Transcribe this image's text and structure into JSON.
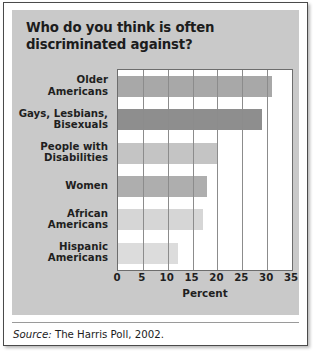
{
  "title": "Who do you think is often discriminated against?",
  "source": {
    "label": "Source:",
    "text": "The Harris Poll, 2002."
  },
  "chart_data": {
    "type": "bar",
    "orientation": "horizontal",
    "title": "Who do you think is often discriminated against?",
    "xlabel": "Percent",
    "ylabel": "",
    "xlim": [
      0,
      35
    ],
    "xticks": [
      0,
      5,
      10,
      15,
      20,
      25,
      30,
      35
    ],
    "grid": true,
    "legend": null,
    "categories": [
      "Older Americans",
      "Gays, Lesbians, Bisexuals",
      "People with Disabilities",
      "Women",
      "African Americans",
      "Hispanic Americans"
    ],
    "values": [
      31,
      29,
      20,
      18,
      17,
      12
    ],
    "colors": [
      "#a8a8a8",
      "#8e8e8e",
      "#c4c4c4",
      "#aeaeae",
      "#d6d6d6",
      "#dcdcdc"
    ]
  }
}
